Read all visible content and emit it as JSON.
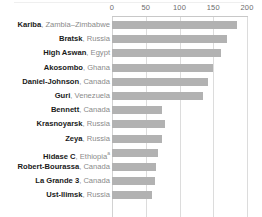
{
  "chart_data": {
    "type": "bar",
    "orientation": "horizontal",
    "title": "",
    "subtitle": "",
    "xlabel": "",
    "ylabel": "",
    "xlim": [
      0,
      200
    ],
    "xticks": [
      0,
      50,
      100,
      150,
      200
    ],
    "xtick_labels": [
      "0",
      "50",
      "100",
      "150",
      "200"
    ],
    "grid": true,
    "legend": false,
    "bar_color": "#b2b2b2",
    "categories": [
      "Kariba, Zambia–Zimbabwe",
      "Bratsk, Russia",
      "High Aswan, Egypt",
      "Akosombo, Ghana",
      "Daniel-Johnson, Canada",
      "Guri, Venezuela",
      "Bennett, Canada",
      "Krasnoyarsk, Russia",
      "Zeya, Russia",
      "Hidase C, Ethiopia",
      "Robert-Bourassa, Canada",
      "La Grande 3, Canada",
      "Ust-Ilimsk, Russia"
    ],
    "values": [
      185,
      170,
      162,
      150,
      142,
      135,
      74,
      78,
      74,
      68,
      65,
      63,
      59
    ]
  },
  "axis": {
    "ticks": [
      {
        "label": "0",
        "value": 0
      },
      {
        "label": "50",
        "value": 50
      },
      {
        "label": "100",
        "value": 100
      },
      {
        "label": "150",
        "value": 150
      },
      {
        "label": "200",
        "value": 200
      }
    ]
  },
  "rows": [
    {
      "name": "Kariba",
      "sep": ", ",
      "country": "Zambia–Zimbabwe",
      "note": "",
      "value": 185
    },
    {
      "name": "Bratsk",
      "sep": ", ",
      "country": "Russia",
      "note": "",
      "value": 170
    },
    {
      "name": "High Aswan",
      "sep": ", ",
      "country": "Egypt",
      "note": "",
      "value": 162
    },
    {
      "name": "Akosombo",
      "sep": ", ",
      "country": "Ghana",
      "note": "",
      "value": 150
    },
    {
      "name": "Daniel-Johnson",
      "sep": ", ",
      "country": "Canada",
      "note": "",
      "value": 142
    },
    {
      "name": "Guri",
      "sep": ", ",
      "country": "Venezuela",
      "note": "",
      "value": 135
    },
    {
      "name": "Bennett",
      "sep": ", ",
      "country": "Canada",
      "note": "",
      "value": 74
    },
    {
      "name": "Krasnoyarsk",
      "sep": ", ",
      "country": "Russia",
      "note": "",
      "value": 78
    },
    {
      "name": "Zeya",
      "sep": ", ",
      "country": "Russia",
      "note": "",
      "value": 74
    },
    {
      "name": "Hidase C",
      "sep": ", ",
      "country": "Ethiopia",
      "note": "a",
      "value": 68
    },
    {
      "name": "Robert-Bourassa",
      "sep": ", ",
      "country": "Canada",
      "note": "",
      "value": 65
    },
    {
      "name": "La Grande 3",
      "sep": ", ",
      "country": "Canada",
      "note": "",
      "value": 63
    },
    {
      "name": "Ust-Ilimsk",
      "sep": ", ",
      "country": "Russia",
      "note": "",
      "value": 59
    }
  ]
}
